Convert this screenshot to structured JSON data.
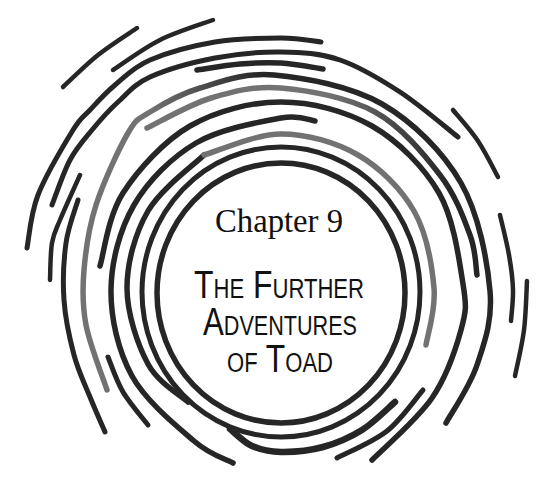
{
  "chapter": {
    "label": "Chapter 9"
  },
  "title": {
    "lines": [
      "The Further",
      "Adventures",
      "of Toad"
    ]
  },
  "colors": {
    "background": "#ffffff",
    "ink": "#262626",
    "faded_ink": "#727272",
    "text": "#111111"
  }
}
